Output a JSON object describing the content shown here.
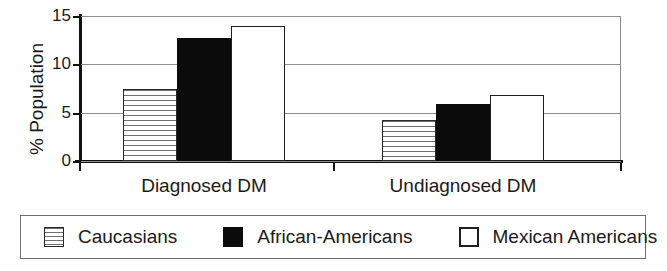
{
  "chart_data": {
    "type": "bar",
    "title": "",
    "subtitle": "",
    "xlabel": "",
    "ylabel": "% Population",
    "categories": [
      "Diagnosed DM",
      "Undiagnosed DM"
    ],
    "series": [
      {
        "name": "Caucasians",
        "values": [
          7.4,
          4.2
        ],
        "fill": "striped",
        "color": "#ffffff"
      },
      {
        "name": "African-Americans",
        "values": [
          12.7,
          5.9
        ],
        "fill": "solid-black",
        "color": "#0b0b0b"
      },
      {
        "name": "Mexican Americans",
        "values": [
          14.0,
          6.8
        ],
        "fill": "open-white",
        "color": "#ffffff"
      }
    ],
    "ylim": [
      0,
      15
    ],
    "yticks": [
      0,
      5,
      10,
      15
    ],
    "ytick_labels": [
      "0",
      "5",
      "10",
      "15"
    ],
    "grid": true,
    "grid_axis": "y",
    "legend_position": "bottom",
    "axis_color": "#111111",
    "grid_color": "#8c8c8c"
  },
  "legend": {
    "items": [
      {
        "label": "Caucasians",
        "swatch": "striped-swatch-icon"
      },
      {
        "label": "African-Americans",
        "swatch": "black-square-swatch-icon"
      },
      {
        "label": "Mexican Americans",
        "swatch": "white-square-swatch-icon"
      }
    ]
  }
}
